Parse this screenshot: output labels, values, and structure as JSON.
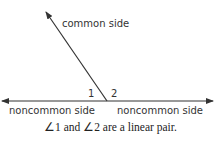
{
  "diagram": {
    "common_side_label": "common side",
    "noncommon_left_label": "noncommon side",
    "noncommon_right_label": "noncommon side",
    "angle1_label": "1",
    "angle2_label": "2",
    "caption": "∠1 and ∠2 are a linear pair.",
    "line_color": "#333333"
  }
}
